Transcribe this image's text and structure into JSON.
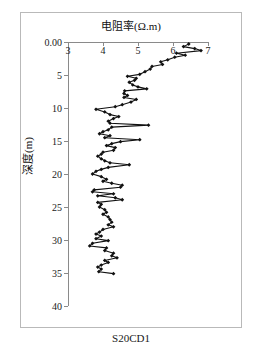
{
  "figure": {
    "caption": "S20CD1",
    "background_color": "#ffffff",
    "frame_color": "#b9b9b9",
    "axis_color": "#8a8a8a",
    "series_color": "#111111"
  },
  "chart_data": {
    "type": "line",
    "title": "电阻率(Ω.m)",
    "xlabel": "电阻率(Ω.m)",
    "ylabel": "深度(m)",
    "orientation": "vertical-depth-profile",
    "x_axis_position": "top",
    "y_axis_direction": "inverted",
    "xlim": [
      3,
      7
    ],
    "ylim": [
      0,
      40
    ],
    "xticks": [
      3,
      4,
      5,
      6,
      7
    ],
    "xtick_labels": [
      "3",
      "4",
      "5",
      "6",
      "7"
    ],
    "yticks": [
      0,
      5,
      10,
      15,
      20,
      25,
      30,
      35,
      40
    ],
    "ytick_labels": [
      "0.00",
      "5",
      "10",
      "15",
      "20",
      "25",
      "30",
      "35",
      "40"
    ],
    "grid": false,
    "legend": "none",
    "marker": "diamond",
    "marker_color": "#111111",
    "line_color": "#111111",
    "series": [
      {
        "name": "电阻率",
        "xlabel_axis": "resistivity",
        "ylabel_axis": "depth",
        "points": [
          [
            6.45,
            0.3
          ],
          [
            6.3,
            0.7
          ],
          [
            6.62,
            1.0
          ],
          [
            6.8,
            1.3
          ],
          [
            6.1,
            1.7
          ],
          [
            6.35,
            2.0
          ],
          [
            6.05,
            2.3
          ],
          [
            5.85,
            2.7
          ],
          [
            5.65,
            3.0
          ],
          [
            5.7,
            3.4
          ],
          [
            5.4,
            3.7
          ],
          [
            5.35,
            4.1
          ],
          [
            5.2,
            4.5
          ],
          [
            5.05,
            4.9
          ],
          [
            4.7,
            5.2
          ],
          [
            4.95,
            5.5
          ],
          [
            4.9,
            5.8
          ],
          [
            4.75,
            6.1
          ],
          [
            4.85,
            6.5
          ],
          [
            5.0,
            6.8
          ],
          [
            5.25,
            7.1
          ],
          [
            4.62,
            7.4
          ],
          [
            4.6,
            7.8
          ],
          [
            4.7,
            8.1
          ],
          [
            4.6,
            8.4
          ],
          [
            4.95,
            8.7
          ],
          [
            4.8,
            9.1
          ],
          [
            4.55,
            9.5
          ],
          [
            4.35,
            9.8
          ],
          [
            3.8,
            10.2
          ],
          [
            4.05,
            10.6
          ],
          [
            4.2,
            11.0
          ],
          [
            4.45,
            11.3
          ],
          [
            4.3,
            11.6
          ],
          [
            4.15,
            12.0
          ],
          [
            4.2,
            12.3
          ],
          [
            5.3,
            12.6
          ],
          [
            4.25,
            12.9
          ],
          [
            4.15,
            13.3
          ],
          [
            4.0,
            13.6
          ],
          [
            3.9,
            13.9
          ],
          [
            4.2,
            14.2
          ],
          [
            4.05,
            14.5
          ],
          [
            5.05,
            14.8
          ],
          [
            4.5,
            15.1
          ],
          [
            4.25,
            15.4
          ],
          [
            4.1,
            15.7
          ],
          [
            4.35,
            16.0
          ],
          [
            4.3,
            16.4
          ],
          [
            4.0,
            16.7
          ],
          [
            3.95,
            17.0
          ],
          [
            3.85,
            17.3
          ],
          [
            3.95,
            17.7
          ],
          [
            4.05,
            18.0
          ],
          [
            4.2,
            18.3
          ],
          [
            4.75,
            18.6
          ],
          [
            4.15,
            19.0
          ],
          [
            3.95,
            19.3
          ],
          [
            3.8,
            19.6
          ],
          [
            3.7,
            20.0
          ],
          [
            3.95,
            20.4
          ],
          [
            4.1,
            20.8
          ],
          [
            4.0,
            21.1
          ],
          [
            4.25,
            21.4
          ],
          [
            4.55,
            21.7
          ],
          [
            4.5,
            22.0
          ],
          [
            3.75,
            22.4
          ],
          [
            3.7,
            22.7
          ],
          [
            4.3,
            23.0
          ],
          [
            3.85,
            23.3
          ],
          [
            4.35,
            23.6
          ],
          [
            4.55,
            23.9
          ],
          [
            3.85,
            24.3
          ],
          [
            3.95,
            24.6
          ],
          [
            3.9,
            25.0
          ],
          [
            4.05,
            25.4
          ],
          [
            4.1,
            25.8
          ],
          [
            4.0,
            26.1
          ],
          [
            4.15,
            26.5
          ],
          [
            4.2,
            26.9
          ],
          [
            4.25,
            27.3
          ],
          [
            4.15,
            27.7
          ],
          [
            4.3,
            28.0
          ],
          [
            4.0,
            28.4
          ],
          [
            3.9,
            28.8
          ],
          [
            3.8,
            29.1
          ],
          [
            3.95,
            29.4
          ],
          [
            3.8,
            29.8
          ],
          [
            4.15,
            30.1
          ],
          [
            3.7,
            30.5
          ],
          [
            3.62,
            30.9
          ],
          [
            4.1,
            31.2
          ],
          [
            4.05,
            31.6
          ],
          [
            4.3,
            32.0
          ],
          [
            4.25,
            32.4
          ],
          [
            4.4,
            32.7
          ],
          [
            4.05,
            33.1
          ],
          [
            4.15,
            33.4
          ],
          [
            3.95,
            33.8
          ],
          [
            3.85,
            34.1
          ],
          [
            3.95,
            34.4
          ],
          [
            3.88,
            34.8
          ],
          [
            4.3,
            35.1
          ]
        ]
      }
    ]
  }
}
